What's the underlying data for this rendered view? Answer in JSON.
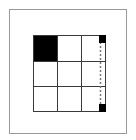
{
  "diagram": {
    "type": "grid-puzzle",
    "rows": 3,
    "cols": 3,
    "filled_cells": [
      {
        "row": 0,
        "col": 0
      }
    ],
    "right_edge_markers": [
      {
        "position": "top",
        "color": "#000000"
      },
      {
        "position": "bottom",
        "color": "#000000"
      }
    ],
    "right_edge_line_style": "dashed",
    "colors": {
      "grid_line": "#3a3a3a",
      "filled": "#000000",
      "frame": "#9a9a9a",
      "background": "#ffffff"
    }
  }
}
